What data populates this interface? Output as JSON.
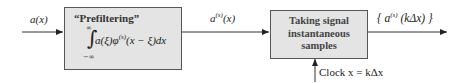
{
  "diagram": {
    "input_label": "a(x)",
    "prefilter_box": {
      "title": "“Prefiltering”",
      "integral_upper": "∞",
      "integral_lower": "−∞",
      "integrand_prefix": "a(ξ)φ",
      "integrand_sup": "(s)",
      "integrand_suffix": "(x − ξ)dx"
    },
    "intermediate_label_base": "a",
    "intermediate_label_sup": "(s)",
    "intermediate_label_arg": "(x)",
    "sampler_box": {
      "line1": "Taking signal",
      "line2": "instantaneous",
      "line3": "samples"
    },
    "output_label_open": "{ a",
    "output_label_sup": "(s)",
    "output_label_rest": " (kΔx) }",
    "clock_label": "Clock x = kΔx",
    "colors": {
      "box_fill": "#e4e4e4",
      "box_border": "#555555",
      "line": "#333333"
    }
  }
}
